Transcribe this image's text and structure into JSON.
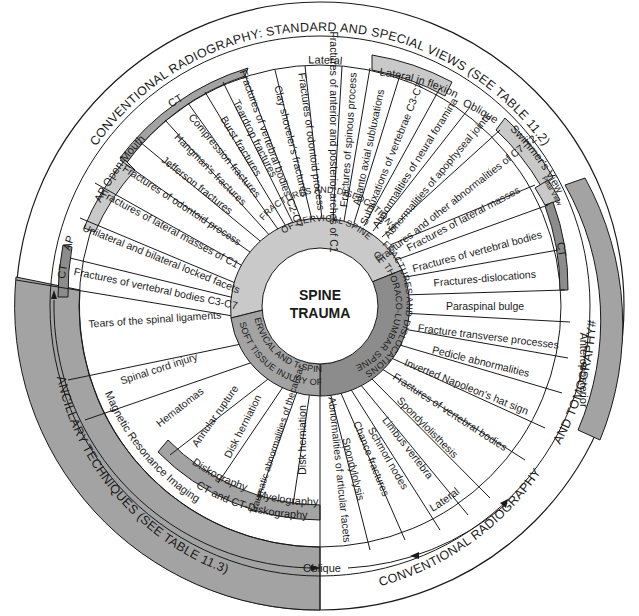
{
  "center": {
    "line1": "SPINE",
    "line2": "TRAUMA"
  },
  "colors": {
    "background": "#ffffff",
    "light_gray": "#c9c9c9",
    "mid_gray": "#a3a3a3",
    "dark_gray": "#8c8c8c",
    "line": "#1a1a1a"
  },
  "categories": [
    {
      "label": "FRACTURES AND DISLOCATIONS OF CERVICAL SPINE",
      "line1": "FRACTURES AND DISLOCATIONS",
      "line2": "OF CERVICAL SPINE",
      "color": "#c9c9c9"
    },
    {
      "label": "FRACTURES AND DISLOCATIONS OF THORACO-LUMBAR SPINE",
      "line1": "FRACTURES AND DISLOCATIONS",
      "line2": "OF THORACO-LUMBAR SPINE",
      "color": "#8c8c8c"
    },
    {
      "label": "SOFT TISSUE INJURY OF CERVICAL AND T-SPINE",
      "line1": "SOFT TISSUE INJURY OF",
      "line2": "CERVICAL AND T-SPINE",
      "color": "#a3a3a3"
    }
  ],
  "outer_titles": {
    "top": "CONVENTIONAL RADIOGRAPHY: STANDARD AND SPECIAL VIEWS (SEE TABLE 11.2)",
    "bottom_right_a": "CONVENTIONAL RADIOGRAPHY",
    "bottom_right_b": "AND TOMOGRAPHY#",
    "left": "ANCILLARY TECHNIQUES (SEE TABLE 11.3)"
  },
  "views": {
    "ap": "AP",
    "ap_open_mouth": "AP Open Mouth",
    "ct_top": "CT",
    "lateral_top": "Lateral",
    "lateral_in_flexion": "Lateral in flexion",
    "oblique_top": "Oblique",
    "swimmers_view": "Swimmer's View",
    "pillar_view": "Pillar View",
    "ct_left": "CT",
    "ct_right": "CT",
    "anteroposterior": "Anteroposterior",
    "lateral_bottom": "Lateral",
    "oblique_bottom": "Oblique",
    "mri": "Magnetic Resonance Imaging",
    "ct_diskography": "CT and CT-Diskography",
    "diskography": "Diskography",
    "myelography": "Myelography"
  },
  "cervical_items": [
    "Fractures of vertebral bodies C3-C7",
    "Unilateral and bilateral locked facets",
    "Fractures of lateral masses of C1",
    "Fractures of odontoid process",
    "Jefferson fractures",
    "Hangman's fractures",
    "Compression fractures",
    "Burst fractures",
    "Teardrop fractures",
    "Fractures of vertebral bodies C2-C7",
    "Clay shoveler's fractures",
    "Fractures of odontoid process",
    "Fractures of anterior and posterior arches of C1",
    "Fractures of spinous process",
    "Atlanto axial subluxations",
    "Subluxations of vertebrae C3-C7",
    "Abnormalities of neural foramina",
    "Abnormalities of apophyseal joints",
    "Fractures and other abnormalities of C7-T2"
  ],
  "thoracolumbar_items": [
    "Fractures of lateral masses",
    "Fractures of vertebral bodies",
    "Fractures-dislocations",
    "Paraspinal bulge",
    "Fracture transverse processes",
    "Pedicle abnormalities",
    "Inverted Napoleon's hat sign",
    "Fractures of vertebral bodies",
    "Spondylolisthesis",
    "Limbus vertebra",
    "Schmorl nodes",
    "Chance fractures",
    "Spondylolysis",
    "Abnormalities of articular facets"
  ],
  "soft_tissue_items": [
    "Disk herniation",
    "Traumatic abnormalities of thecal sac",
    "Disk herniation",
    "Annular rupture",
    "Hematomas",
    "Spinal cord injury",
    "Tears of the spinal ligaments"
  ]
}
